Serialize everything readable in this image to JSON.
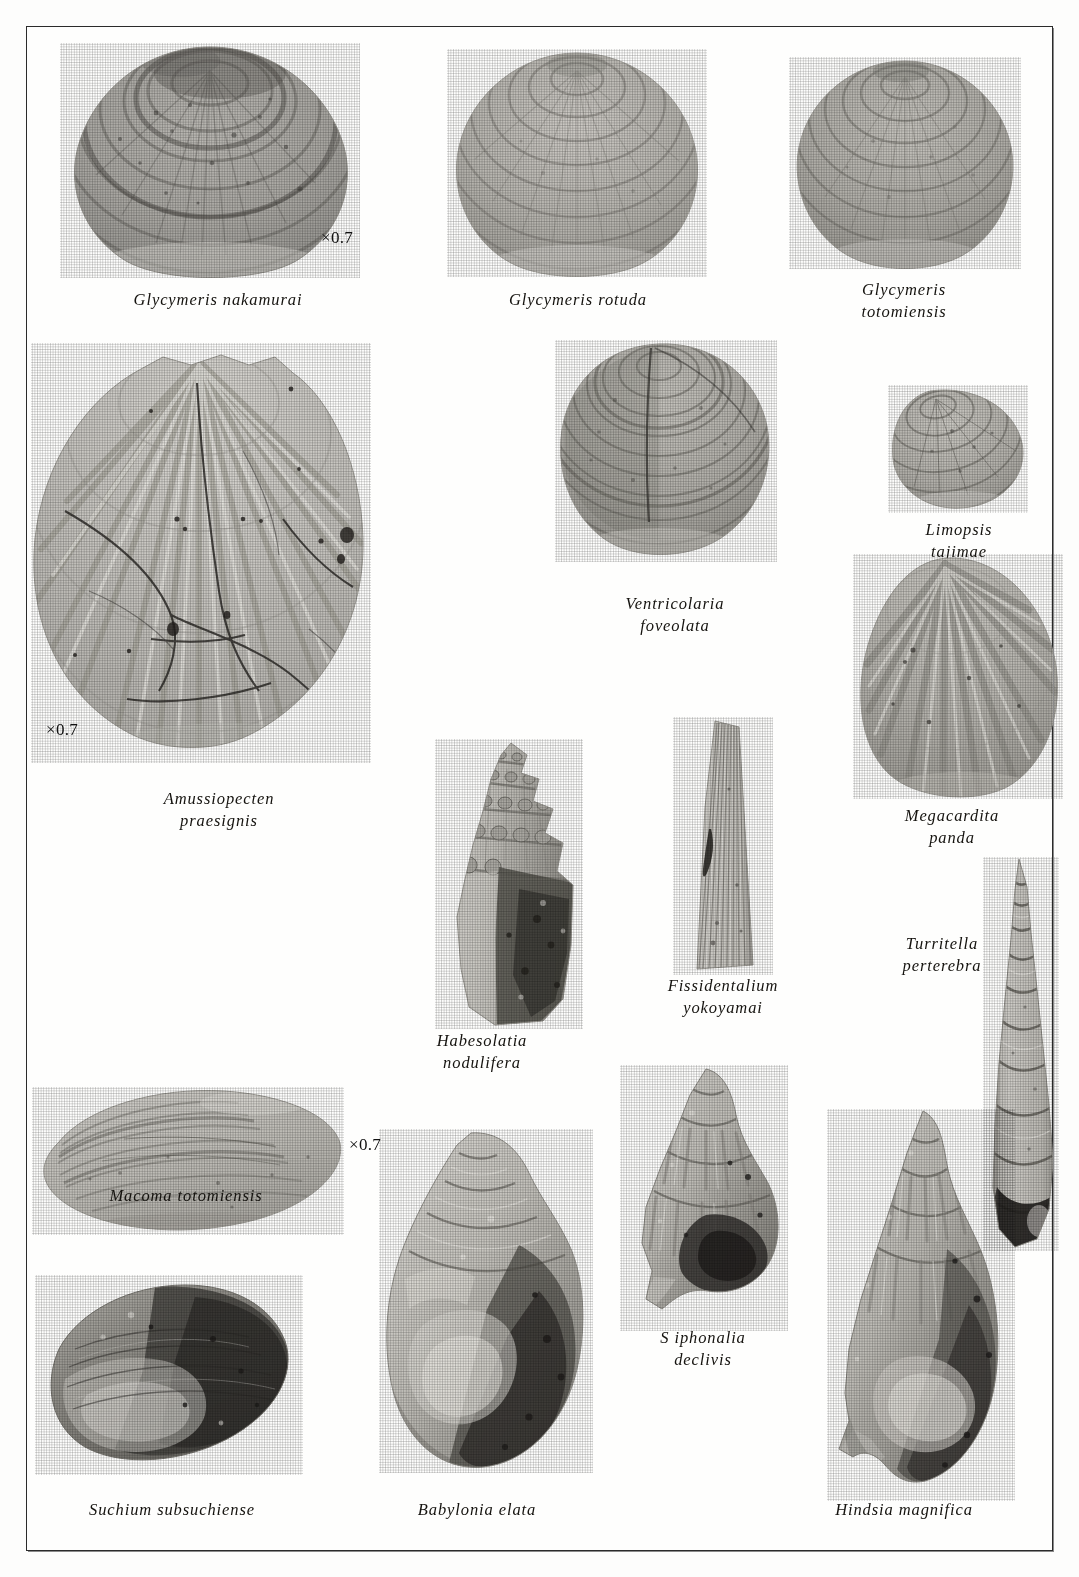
{
  "plate": {
    "kind": "paleontological-photographic-plate",
    "medium": "grayscale halftone photographs",
    "background_color": "#fefefd",
    "frame_color": "#2b2b2b"
  },
  "scale_marks": [
    {
      "id": "scale-glycymeris-nakamurai",
      "text": "×0.7"
    },
    {
      "id": "scale-amussiopecten-praesignis",
      "text": "×0.7"
    },
    {
      "id": "scale-macoma-totomiensis",
      "text": "×0.7"
    }
  ],
  "specimens": [
    {
      "id": "glycymeris-nakamurai",
      "label": "Glycymeris nakamurai",
      "genus": "Glycymeris",
      "species": "nakamurai",
      "form": "bivalve-orbicular",
      "scale": "×0.7"
    },
    {
      "id": "glycymeris-rotuda",
      "label": "Glycymeris rotuda",
      "genus": "Glycymeris",
      "species": "rotuda",
      "form": "bivalve-orbicular",
      "scale": ""
    },
    {
      "id": "glycymeris-totomiensis",
      "label": "Glycymeris\ntotomiensis",
      "genus": "Glycymeris",
      "species": "totomiensis",
      "form": "bivalve-orbicular",
      "scale": ""
    },
    {
      "id": "amussiopecten-praesignis",
      "label": "Amussiopecten\npraesignis",
      "genus": "Amussiopecten",
      "species": "praesignis",
      "form": "pectinid-scallop-ribbed",
      "scale": "×0.7"
    },
    {
      "id": "ventricolaria-foveolata",
      "label": "Ventricolaria\nfoveolata",
      "genus": "Ventricolaria",
      "species": "foveolata",
      "form": "bivalve-venerid",
      "scale": ""
    },
    {
      "id": "limopsis-tajimae",
      "label": "Limopsis\ntajimae",
      "genus": "Limopsis",
      "species": "tajimae",
      "form": "bivalve-small-oblique",
      "scale": ""
    },
    {
      "id": "megacardita-panda",
      "label": "Megacardita\npanda",
      "genus": "Megacardita",
      "species": "panda",
      "form": "bivalve-radially-ribbed",
      "scale": ""
    },
    {
      "id": "habesolatia-nodulifera",
      "label": "Habesolatia\nnodulifera",
      "genus": "Habesolatia",
      "species": "nodulifera",
      "form": "gastropod-nodulose-spire",
      "scale": ""
    },
    {
      "id": "fissidentalium-yokoyamai",
      "label": "Fissidentalium\nyokoyamai",
      "genus": "Fissidentalium",
      "species": "yokoyamai",
      "form": "scaphopod-tusk",
      "scale": ""
    },
    {
      "id": "turritella-perterebra",
      "label": "Turritella\nperterebra",
      "genus": "Turritella",
      "species": "perterebra",
      "form": "gastropod-high-spire",
      "scale": ""
    },
    {
      "id": "macoma-totomiensis",
      "label": "Macoma totomiensis",
      "genus": "Macoma",
      "species": "totomiensis",
      "form": "bivalve-tellinid",
      "scale": "×0.7"
    },
    {
      "id": "suchium-subsuchiense",
      "label": "Suchium subsuchiense",
      "genus": "Suchium",
      "species": "subsuchiense",
      "form": "gastropod-flattened",
      "scale": ""
    },
    {
      "id": "babylonia-elata",
      "label": "Babylonia elata",
      "genus": "Babylonia",
      "species": "elata",
      "form": "gastropod-globose",
      "scale": ""
    },
    {
      "id": "siphonalia-declivis",
      "label": "S iphonalia\ndeclivis",
      "genus": "Siphonalia",
      "species": "declivis",
      "form": "gastropod-fusiform",
      "scale": ""
    },
    {
      "id": "hindsia-magnifica",
      "label": "Hindsia magnifica",
      "genus": "Hindsia",
      "species": "magnifica",
      "form": "gastropod-fusiform-elongate",
      "scale": ""
    }
  ]
}
